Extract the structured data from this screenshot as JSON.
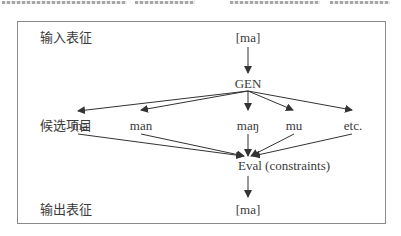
{
  "diagram": {
    "row_labels": {
      "input": "输入表征",
      "candidates": "候选项目",
      "output": "输出表征"
    },
    "input_form": "[ma]",
    "generator": "GEN",
    "candidates": [
      "ma",
      "man",
      "maŋ",
      "mu",
      "etc."
    ],
    "evaluator": "Eval (constraints)",
    "output_form": "[ma]",
    "edges": [
      {
        "from": "input",
        "to": "GEN"
      },
      {
        "from": "GEN",
        "to": "ma"
      },
      {
        "from": "GEN",
        "to": "man"
      },
      {
        "from": "GEN",
        "to": "maŋ"
      },
      {
        "from": "GEN",
        "to": "mu"
      },
      {
        "from": "GEN",
        "to": "etc."
      },
      {
        "from": "ma",
        "to": "Eval"
      },
      {
        "from": "man",
        "to": "Eval"
      },
      {
        "from": "maŋ",
        "to": "Eval"
      },
      {
        "from": "mu",
        "to": "Eval"
      },
      {
        "from": "etc.",
        "to": "Eval"
      },
      {
        "from": "Eval",
        "to": "output"
      }
    ],
    "colors": {
      "line": "#333333",
      "frame": "#8a8a8a",
      "text": "#3a3a3a"
    }
  }
}
